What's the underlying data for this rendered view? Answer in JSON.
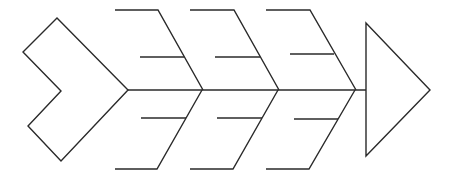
{
  "diagram": {
    "type": "fishbone",
    "title": "",
    "colors": {
      "line": "#2a2a2a",
      "background": "#ffffff"
    },
    "tail": {
      "shape": "chevron",
      "label": ""
    },
    "head": {
      "shape": "triangle",
      "label": ""
    },
    "bones": [
      {
        "label": "",
        "side": "top",
        "causes": [
          {
            "label": ""
          }
        ]
      },
      {
        "label": "",
        "side": "bottom",
        "causes": [
          {
            "label": ""
          }
        ]
      },
      {
        "label": "",
        "side": "top",
        "causes": [
          {
            "label": ""
          }
        ]
      },
      {
        "label": "",
        "side": "bottom",
        "causes": [
          {
            "label": ""
          }
        ]
      },
      {
        "label": "",
        "side": "top",
        "causes": [
          {
            "label": ""
          }
        ]
      },
      {
        "label": "",
        "side": "bottom",
        "causes": [
          {
            "label": ""
          }
        ]
      }
    ]
  }
}
